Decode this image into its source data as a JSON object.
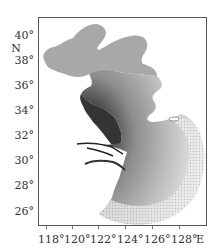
{
  "map": {
    "type": "model-grid-map",
    "region": "Bohai, Yellow Sea and East China Sea",
    "colors": {
      "bohai_fill": "#a8a8a8",
      "coast_dark": "#1a1a1a",
      "sea_mid": "#9a9a9a",
      "sea_light": "#e6e6e6",
      "frame": "#555555",
      "land": "#ffffff"
    },
    "lat_axis": {
      "unit_label": "N",
      "ticks": [
        {
          "label": "40°",
          "y": 30
        },
        {
          "label": "38°",
          "y": 55
        },
        {
          "label": "36°",
          "y": 80
        },
        {
          "label": "34°",
          "y": 105
        },
        {
          "label": "32°",
          "y": 130
        },
        {
          "label": "30°",
          "y": 155
        },
        {
          "label": "28°",
          "y": 180
        },
        {
          "label": "26°",
          "y": 206
        }
      ],
      "unit_y": 43
    },
    "lon_axis": {
      "unit_label": "E",
      "ticks": [
        {
          "label": "118°",
          "x": 38
        },
        {
          "label": "120°",
          "x": 64
        },
        {
          "label": "122°",
          "x": 90
        },
        {
          "label": "124°",
          "x": 117
        },
        {
          "label": "126°",
          "x": 144
        },
        {
          "label": "128°",
          "x": 171
        }
      ],
      "unit_x": 196
    }
  }
}
